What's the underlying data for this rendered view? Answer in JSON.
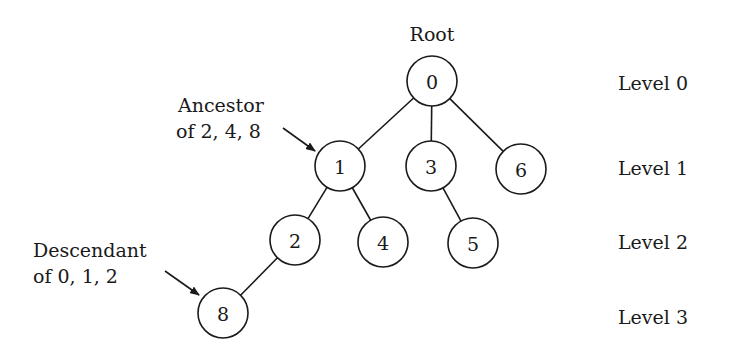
{
  "root_label": "Root",
  "nodes": [
    {
      "id": "0",
      "label": "0",
      "x": 432,
      "y": 81,
      "level": 0
    },
    {
      "id": "1",
      "label": "1",
      "x": 340,
      "y": 166,
      "level": 1
    },
    {
      "id": "3",
      "label": "3",
      "x": 431,
      "y": 166,
      "level": 1
    },
    {
      "id": "6",
      "label": "6",
      "x": 521,
      "y": 169,
      "level": 1
    },
    {
      "id": "2",
      "label": "2",
      "x": 295,
      "y": 240,
      "level": 2
    },
    {
      "id": "4",
      "label": "4",
      "x": 383,
      "y": 242,
      "level": 2
    },
    {
      "id": "5",
      "label": "5",
      "x": 473,
      "y": 243,
      "level": 2
    },
    {
      "id": "8",
      "label": "8",
      "x": 223,
      "y": 313,
      "level": 3
    }
  ],
  "edges": [
    {
      "from": "0",
      "to": "1"
    },
    {
      "from": "0",
      "to": "3"
    },
    {
      "from": "0",
      "to": "6"
    },
    {
      "from": "1",
      "to": "2"
    },
    {
      "from": "1",
      "to": "4"
    },
    {
      "from": "3",
      "to": "5"
    },
    {
      "from": "2",
      "to": "8"
    }
  ],
  "levels": [
    {
      "label": "Level 0",
      "y": 84
    },
    {
      "label": "Level 1",
      "y": 169
    },
    {
      "label": "Level 2",
      "y": 243
    },
    {
      "label": "Level 3",
      "y": 318
    }
  ],
  "annotations": {
    "ancestor": {
      "line1": "Ancestor",
      "line2": "of 2, 4, 8",
      "target": "1"
    },
    "descendant": {
      "line1": "Descendant",
      "line2": "of 0, 1, 2",
      "target": "8"
    }
  },
  "colors": {
    "stroke": "#1a1a1a",
    "background": "#ffffff"
  }
}
